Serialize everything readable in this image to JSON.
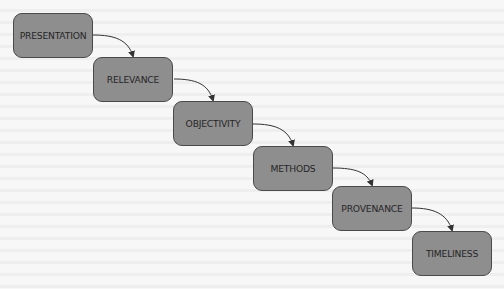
{
  "diagram": {
    "type": "flow",
    "direction": "diagonal top-left to bottom-right",
    "nodes": [
      {
        "id": "presentation",
        "label": "PRESENTATION",
        "x": 13,
        "y": 13
      },
      {
        "id": "relevance",
        "label": "RELEVANCE",
        "x": 93,
        "y": 57
      },
      {
        "id": "objectivity",
        "label": "OBJECTIVITY",
        "x": 173,
        "y": 101
      },
      {
        "id": "methods",
        "label": "METHODS",
        "x": 253,
        "y": 146
      },
      {
        "id": "provenance",
        "label": "PROVENANCE",
        "x": 332,
        "y": 186
      },
      {
        "id": "timeliness",
        "label": "TIMELINESS",
        "x": 412,
        "y": 231
      }
    ],
    "edges": [
      {
        "from": "presentation",
        "to": "relevance"
      },
      {
        "from": "relevance",
        "to": "objectivity"
      },
      {
        "from": "objectivity",
        "to": "methods"
      },
      {
        "from": "methods",
        "to": "provenance"
      },
      {
        "from": "provenance",
        "to": "timeliness"
      }
    ],
    "colors": {
      "node_fill": "#8e8e8e",
      "node_border": "#4a4a4a",
      "text": "#262626",
      "arrow": "#333333",
      "background": "#f7f7f7"
    }
  }
}
